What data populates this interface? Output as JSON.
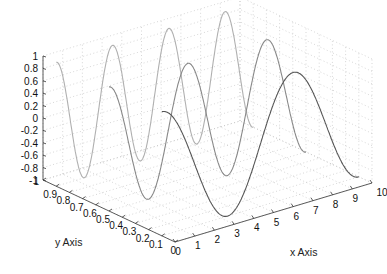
{
  "chart_data": {
    "type": "line",
    "subtype": "plot3",
    "title": "",
    "xlabel": "x Axis",
    "ylabel": "y Axis",
    "zlabel": "",
    "xlim": [
      0,
      10
    ],
    "ylim": [
      0,
      1
    ],
    "zlim": [
      -1,
      1
    ],
    "x_ticks": [
      "0",
      "1",
      "2",
      "3",
      "4",
      "5",
      "6",
      "7",
      "8",
      "9",
      "10"
    ],
    "y_ticks": [
      "0",
      "0.1",
      "0.2",
      "0.3",
      "0.4",
      "0.5",
      "0.6",
      "0.7",
      "0.8",
      "0.9",
      "1"
    ],
    "z_ticks": [
      "-1",
      "-0.8",
      "-0.6",
      "-0.4",
      "-0.2",
      "0",
      "0.2",
      "0.4",
      "0.6",
      "0.8",
      "1"
    ],
    "grid": true,
    "legend": null,
    "series": [
      {
        "name": "front",
        "y": 0.1,
        "x_range": [
          0,
          10
        ],
        "function": "sin",
        "cycles": 1.5,
        "color": "#555555"
      },
      {
        "name": "middle",
        "y": 0.5,
        "x_range": [
          0,
          10
        ],
        "function": "sin",
        "cycles": 2.5,
        "color": "#888888"
      },
      {
        "name": "back",
        "y": 0.9,
        "x_range": [
          0,
          10
        ],
        "function": "sin",
        "cycles": 3.5,
        "color": "#b0b0b0"
      }
    ]
  },
  "axes": {
    "x_label": "x Axis",
    "y_label": "y Axis"
  }
}
